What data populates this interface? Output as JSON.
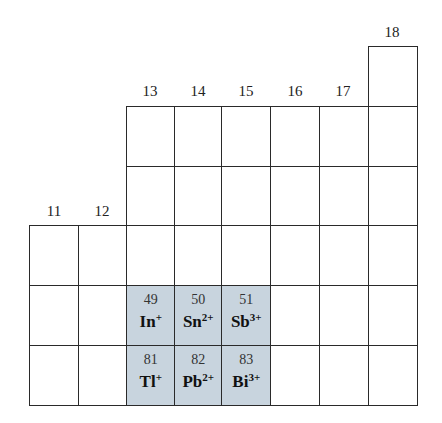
{
  "groups": [
    {
      "label": "11",
      "col": 0
    },
    {
      "label": "12",
      "col": 1
    },
    {
      "label": "13",
      "col": 2
    },
    {
      "label": "14",
      "col": 3
    },
    {
      "label": "15",
      "col": 4
    },
    {
      "label": "16",
      "col": 5
    },
    {
      "label": "17",
      "col": 6
    },
    {
      "label": "18",
      "col": 7
    }
  ],
  "highlight_color": "#c8d4de",
  "elements": [
    {
      "number": "49",
      "symbol": "In",
      "charge": "+",
      "col": 2,
      "row": 4
    },
    {
      "number": "50",
      "symbol": "Sn",
      "charge": "2+",
      "col": 3,
      "row": 4
    },
    {
      "number": "51",
      "symbol": "Sb",
      "charge": "3+",
      "col": 4,
      "row": 4
    },
    {
      "number": "81",
      "symbol": "Tl",
      "charge": "+",
      "col": 2,
      "row": 5
    },
    {
      "number": "82",
      "symbol": "Pb",
      "charge": "2+",
      "col": 3,
      "row": 5
    },
    {
      "number": "83",
      "symbol": "Bi",
      "charge": "3+",
      "col": 4,
      "row": 5
    }
  ]
}
